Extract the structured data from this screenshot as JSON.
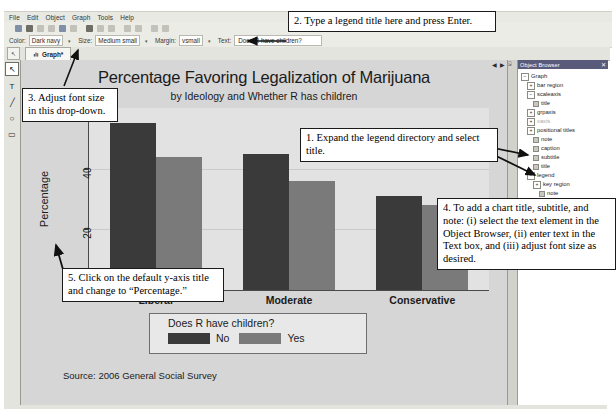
{
  "window": {
    "menus": [
      "File",
      "Edit",
      "Object",
      "Graph",
      "Tools",
      "Help"
    ],
    "graph_tab": "Graph*",
    "nav_prev": "◀",
    "nav_next": "▶"
  },
  "options_bar": {
    "color_label": "Color:",
    "color_value": "Dark navy",
    "size_label": "Size:",
    "size_value": "Medium small",
    "margin_label": "Margin:",
    "margin_value": "vsmall",
    "text_label": "Text:",
    "text_value": "Does R have children?",
    "caret": "▾"
  },
  "palette": {
    "pointer": "↖",
    "text_tool": "T",
    "line_tool": "╱",
    "ellipse_tool": "○",
    "rect_tool": "▭"
  },
  "chart_data": {
    "type": "bar",
    "title": "Percentage Favoring Legalization of Marijuana",
    "subtitle": "by Ideology and Whether R has children",
    "xlabel": "",
    "ylabel": "Percentage",
    "categories": [
      "Liberal",
      "Moderate",
      "Conservative"
    ],
    "series": [
      {
        "name": "No",
        "color": "#3a3a3a",
        "values": [
          55,
          45,
          31
        ]
      },
      {
        "name": "Yes",
        "color": "#7a7a7a",
        "values": [
          44,
          36,
          28
        ]
      }
    ],
    "legend_title": "Does R have children?",
    "legend_position": "bottom",
    "ylim": [
      0,
      60
    ],
    "yticks": [
      20,
      40
    ],
    "grid": true,
    "note": "Source: 2006 General Social Survey"
  },
  "object_browser": {
    "header": "Object Browser",
    "pin": "⍄",
    "close": "✕",
    "nodes": [
      {
        "label": "Graph",
        "indent": 0,
        "marker": "expanded"
      },
      {
        "label": "bar region",
        "indent": 1,
        "marker": "collapsed"
      },
      {
        "label": "scaleaxis",
        "indent": 1,
        "marker": "expanded"
      },
      {
        "label": "title",
        "indent": 2,
        "marker": "leaf"
      },
      {
        "label": "grpaxis",
        "indent": 1,
        "marker": "collapsed"
      },
      {
        "label": "xaxis",
        "indent": 1,
        "marker": "collapsed",
        "dim": true
      },
      {
        "label": "positional titles",
        "indent": 1,
        "marker": "collapsed"
      },
      {
        "label": "note",
        "indent": 2,
        "marker": "leaf"
      },
      {
        "label": "caption",
        "indent": 2,
        "marker": "leaf"
      },
      {
        "label": "subtitle",
        "indent": 2,
        "marker": "leaf"
      },
      {
        "label": "title",
        "indent": 2,
        "marker": "leaf"
      },
      {
        "label": "legend",
        "indent": 1,
        "marker": "expanded"
      },
      {
        "label": "key region",
        "indent": 2,
        "marker": "collapsed"
      },
      {
        "label": "note",
        "indent": 3,
        "marker": "leaf"
      },
      {
        "label": "caption",
        "indent": 3,
        "marker": "leaf"
      },
      {
        "label": "subtitle",
        "indent": 3,
        "marker": "leaf"
      },
      {
        "label": "title",
        "indent": 3,
        "marker": "leaf",
        "selected": true
      }
    ]
  },
  "callouts": {
    "one": "1. Expand the legend directory and select title.",
    "two": "2. Type a legend title here and press Enter.",
    "three": "3. Adjust font size in this drop-down.",
    "four": "4. To add a chart title, subtitle, and note: (i) select the text element in the Object Browser, (ii) enter text in the Text box, and (iii) adjust font size as desired.",
    "five": "5. Click on the default y-axis title and change to “Percentage.”"
  }
}
